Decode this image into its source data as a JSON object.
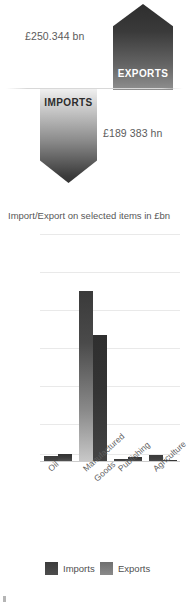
{
  "infographic": {
    "exports_value": "£250.344 bn",
    "exports_label": "EXPORTS",
    "imports_value": "£189 383 hn",
    "imports_label": "IMPORTS",
    "exports_arrow_icon": "arrow-up-icon",
    "imports_arrow_icon": "arrow-down-icon"
  },
  "chart_data": {
    "type": "bar",
    "title": "Import/Export on selected items in £bn",
    "xlabel": "",
    "ylabel": "",
    "ylim": [
      0,
      300
    ],
    "yticks": [
      300,
      250,
      200,
      150,
      100,
      50,
      10,
      0
    ],
    "ytick_labels": [
      "300",
      "250",
      "200",
      "150",
      "100",
      "50",
      "10",
      "0"
    ],
    "grid": true,
    "legend_position": "bottom",
    "categories": [
      "Oil",
      "Manufactured Goods",
      "Publishing",
      "Agriculture"
    ],
    "category_lines": [
      [
        "Oil"
      ],
      [
        "Manufactured",
        "Goods"
      ],
      [
        "Publishing"
      ],
      [
        "Agriculture"
      ]
    ],
    "series": [
      {
        "name": "Imports",
        "color": "#434343",
        "values": [
          8,
          225,
          4,
          9
        ]
      },
      {
        "name": "Exports",
        "color": "#7d7d7d",
        "values": [
          10,
          167,
          7,
          2
        ]
      }
    ]
  },
  "legend": {
    "imports": "Imports",
    "exports": "Exports"
  },
  "colors": {
    "bar_imports": "#434343",
    "bar_exports": "#7d7d7d",
    "grid": "#e9e9e9",
    "text": "#5b5b5b",
    "background": "#ffffff"
  }
}
